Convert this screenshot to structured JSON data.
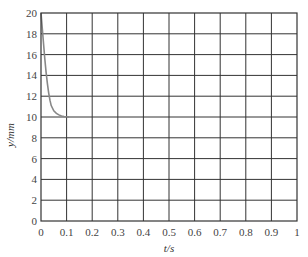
{
  "chart_data": {
    "type": "line",
    "title": "",
    "xlabel": "t/s",
    "ylabel": "y/mm",
    "xlim": [
      0,
      1
    ],
    "ylim": [
      0,
      20
    ],
    "grid": true,
    "legend": null,
    "xticks": [
      "0",
      "0.1",
      "0.2",
      "0.3",
      "0.4",
      "0.5",
      "0.6",
      "0.7",
      "0.8",
      "0.9",
      "1"
    ],
    "yticks": [
      "0",
      "2",
      "4",
      "6",
      "8",
      "10",
      "12",
      "14",
      "16",
      "18",
      "20"
    ],
    "series": [
      {
        "name": "y",
        "color": "#888888",
        "x": [
          0.0,
          0.005,
          0.01,
          0.015,
          0.02,
          0.025,
          0.03,
          0.035,
          0.04,
          0.05,
          0.06,
          0.07,
          0.08,
          0.09,
          0.1,
          0.11
        ],
        "y": [
          20.0,
          18.5,
          17.0,
          15.6,
          14.3,
          13.2,
          12.3,
          11.6,
          11.1,
          10.6,
          10.35,
          10.2,
          10.1,
          10.05,
          10.02,
          10.0
        ]
      }
    ]
  },
  "plot_box": {
    "left": 41,
    "top": 13,
    "width": 256,
    "height": 208
  },
  "colors": {
    "grid": "#333333",
    "axis": "#333333",
    "line": "#888888"
  }
}
